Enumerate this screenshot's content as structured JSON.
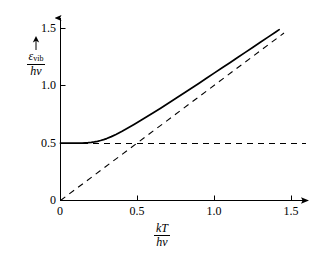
{
  "chart_data": {
    "type": "line",
    "title": "",
    "xlabel": "kT/hv",
    "ylabel": "ε_vib/hv",
    "xlim": [
      0,
      1.55
    ],
    "ylim": [
      0,
      1.58
    ],
    "grid": false,
    "legend_position": "none",
    "xticks": [
      "0",
      "0.5",
      "1.0",
      "1.5"
    ],
    "xtick_values": [
      0,
      0.5,
      1.0,
      1.5
    ],
    "yticks": [
      "0",
      "0.5",
      "1.0",
      "1.5"
    ],
    "ytick_values": [
      0,
      0.5,
      1.0,
      1.5
    ],
    "series": [
      {
        "name": "vibrational-energy-curve",
        "style": "solid",
        "color": "#000000",
        "description": "eps_vib/hv = 1/2 + 1/(exp(hv/kT) - 1)",
        "x": [
          0.0,
          0.05,
          0.1,
          0.14,
          0.18,
          0.2,
          0.22,
          0.24,
          0.26,
          0.28,
          0.3,
          0.33,
          0.36,
          0.4,
          0.44,
          0.48,
          0.52,
          0.56,
          0.6,
          0.65,
          0.7,
          0.75,
          0.8,
          0.85,
          0.9,
          0.95,
          1.0,
          1.05,
          1.1,
          1.15,
          1.2,
          1.25,
          1.3,
          1.35,
          1.4,
          1.42
        ],
        "y": [
          0.5,
          0.5,
          0.5,
          0.501,
          0.504,
          0.507,
          0.511,
          0.516,
          0.523,
          0.531,
          0.54,
          0.557,
          0.576,
          0.604,
          0.634,
          0.665,
          0.697,
          0.73,
          0.763,
          0.805,
          0.848,
          0.891,
          0.935,
          0.979,
          1.023,
          1.068,
          1.113,
          1.157,
          1.202,
          1.247,
          1.292,
          1.337,
          1.382,
          1.427,
          1.472,
          1.49
        ]
      },
      {
        "name": "classical-limit-line",
        "style": "dashed",
        "color": "#000000",
        "description": "y = x classical asymptote through origin",
        "x": [
          0.0,
          1.45
        ],
        "y": [
          0.0,
          1.45
        ]
      },
      {
        "name": "zero-point-energy-line",
        "style": "dashed",
        "color": "#000000",
        "description": "y = 0.5 zero point energy asymptote",
        "x": [
          0.0,
          1.55
        ],
        "y": [
          0.5,
          0.5
        ]
      }
    ]
  },
  "axes": {
    "y_label": {
      "numerator_symbol": "ε",
      "numerator_subscript": "vib",
      "denominator": "hv",
      "arrow": "up-arrow"
    },
    "x_label": {
      "numerator": "kT",
      "denominator": "hv"
    }
  }
}
